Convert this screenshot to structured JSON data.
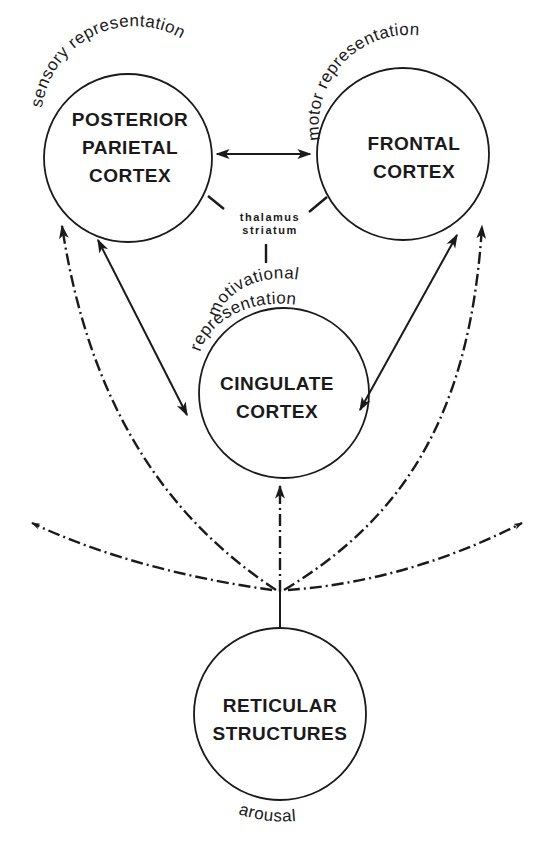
{
  "diagram": {
    "nodes": {
      "posterior_parietal": {
        "line1": "POSTERIOR",
        "line2": "PARIETAL",
        "line3": "CORTEX",
        "annotation": "sensory representation"
      },
      "frontal": {
        "line1": "FRONTAL",
        "line2": "CORTEX",
        "annotation": "motor representation"
      },
      "cingulate": {
        "line1": "CINGULATE",
        "line2": "CORTEX",
        "annotation_line1": "motivational",
        "annotation_line2": "representation"
      },
      "reticular": {
        "line1": "RETICULAR",
        "line2": "STRUCTURES",
        "annotation": "arousal"
      }
    },
    "hub": {
      "line1": "thalamus",
      "line2": "striatum"
    },
    "edges": [
      {
        "from": "posterior_parietal",
        "to": "frontal",
        "style": "solid",
        "direction": "bidirectional"
      },
      {
        "from": "posterior_parietal",
        "to": "cingulate",
        "style": "solid",
        "direction": "bidirectional"
      },
      {
        "from": "frontal",
        "to": "cingulate",
        "style": "solid",
        "direction": "bidirectional"
      },
      {
        "from": "reticular",
        "to": "posterior_parietal",
        "style": "dash-dot",
        "direction": "forward"
      },
      {
        "from": "reticular",
        "to": "frontal",
        "style": "dash-dot",
        "direction": "forward"
      },
      {
        "from": "reticular",
        "to": "cingulate",
        "style": "dash-dot",
        "direction": "forward"
      },
      {
        "from": "reticular",
        "to": "left-offscreen",
        "style": "dash-dot",
        "direction": "forward"
      },
      {
        "from": "reticular",
        "to": "right-offscreen",
        "style": "dash-dot",
        "direction": "forward"
      },
      {
        "from": "thalamus_striatum",
        "to": [
          "posterior_parietal",
          "frontal",
          "cingulate"
        ],
        "style": "connector-ticks",
        "direction": "none"
      }
    ]
  }
}
